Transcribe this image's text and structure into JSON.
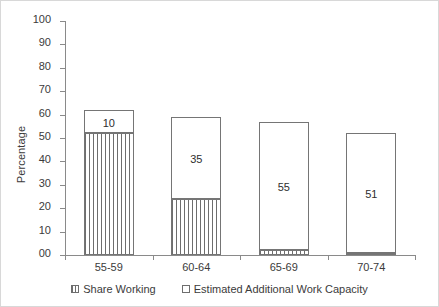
{
  "chart_data": {
    "type": "bar",
    "stacked": true,
    "title": "",
    "xlabel": "",
    "ylabel": "Percentage",
    "categories": [
      "55-59",
      "60-64",
      "65-69",
      "70-74"
    ],
    "ylim": [
      0,
      100
    ],
    "ytick_labels": [
      "00",
      "10",
      "20",
      "30",
      "40",
      "50",
      "60",
      "70",
      "80",
      "90",
      "100"
    ],
    "ytick_values": [
      0,
      10,
      20,
      30,
      40,
      50,
      60,
      70,
      80,
      90,
      100
    ],
    "grid": false,
    "legend_position": "bottom",
    "series": [
      {
        "name": "Share Working",
        "pattern": "vertical-hatch",
        "values": [
          52,
          24,
          2,
          1
        ],
        "labels": [
          "",
          "",
          "",
          ""
        ]
      },
      {
        "name": "Estimated Additional Work Capacity",
        "pattern": "solid-white",
        "values": [
          10,
          35,
          55,
          51
        ],
        "labels": [
          "10",
          "35",
          "55",
          "51"
        ]
      }
    ],
    "totals": [
      62,
      59,
      57,
      52
    ]
  },
  "legend": {
    "items": [
      {
        "label": "Share Working",
        "swatch": "hatched-square-icon"
      },
      {
        "label": "Estimated Additional Work Capacity",
        "swatch": "empty-square-icon"
      }
    ]
  }
}
